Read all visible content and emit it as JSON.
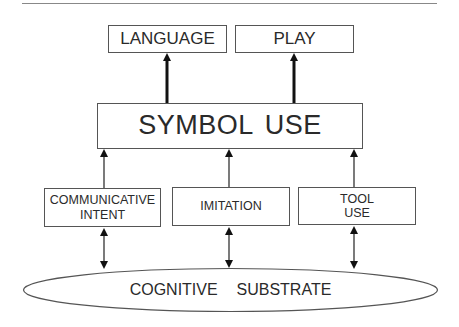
{
  "diagram": {
    "top_nodes": [
      {
        "id": "language",
        "label": "LANGUAGE"
      },
      {
        "id": "play",
        "label": "PLAY"
      }
    ],
    "middle_node": {
      "id": "symbol-use",
      "label": "SYMBOL USE"
    },
    "lower_nodes": [
      {
        "id": "communicative-intent",
        "label": "COMMUNICATIVE INTENT"
      },
      {
        "id": "imitation",
        "label": "IMITATION"
      },
      {
        "id": "tool-use",
        "label": "TOOL USE"
      }
    ],
    "base_node": {
      "id": "cognitive-substrate",
      "label": "COGNITIVE  SUBSTRATE"
    },
    "edges": [
      {
        "from": "symbol-use",
        "to": "language",
        "type": "single-arrow-bold"
      },
      {
        "from": "symbol-use",
        "to": "play",
        "type": "single-arrow-bold"
      },
      {
        "from": "communicative-intent",
        "to": "symbol-use",
        "type": "single-arrow"
      },
      {
        "from": "imitation",
        "to": "symbol-use",
        "type": "single-arrow"
      },
      {
        "from": "tool-use",
        "to": "symbol-use",
        "type": "single-arrow"
      },
      {
        "from": "communicative-intent",
        "to": "cognitive-substrate",
        "type": "double-arrow"
      },
      {
        "from": "imitation",
        "to": "cognitive-substrate",
        "type": "double-arrow"
      },
      {
        "from": "tool-use",
        "to": "cognitive-substrate",
        "type": "double-arrow"
      }
    ]
  }
}
